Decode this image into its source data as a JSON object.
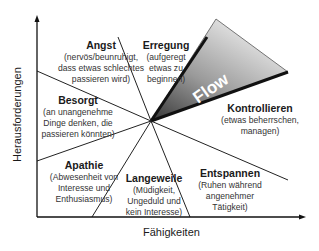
{
  "diagram": {
    "axes": {
      "y_label": "Herausforderungen",
      "x_label": "Fähigkeiten"
    },
    "flow": {
      "label": "Flow",
      "fill_light": "#e6e6e6",
      "fill_dark": "#4a4a4a"
    },
    "regions": [
      {
        "id": "angst",
        "title": "Angst",
        "desc": "(nervös/beunruhigt,\ndass etwas schlechtes\npassieren wird)"
      },
      {
        "id": "erregung",
        "title": "Erregung",
        "desc": "(aufgeregt\netwas zu\nbeginnen)"
      },
      {
        "id": "besorgt",
        "title": "Besorgt",
        "desc": "(an unangenehme\nDinge denken, die\npassieren könnten)"
      },
      {
        "id": "kontrollieren",
        "title": "Kontrollieren",
        "desc": "(etwas beherrschen,\nmanagen)"
      },
      {
        "id": "apathie",
        "title": "Apathie",
        "desc": "(Abwesenheit von\nInteresse und\nEnthusiasmus)"
      },
      {
        "id": "langeweile",
        "title": "Langeweile",
        "desc": "(Müdigkeit,\nUngeduld und\nkein Interesse)"
      },
      {
        "id": "entspannen",
        "title": "Entspannen",
        "desc": "(Ruhen während\nangenehmer\nTätigkeit)"
      }
    ]
  }
}
